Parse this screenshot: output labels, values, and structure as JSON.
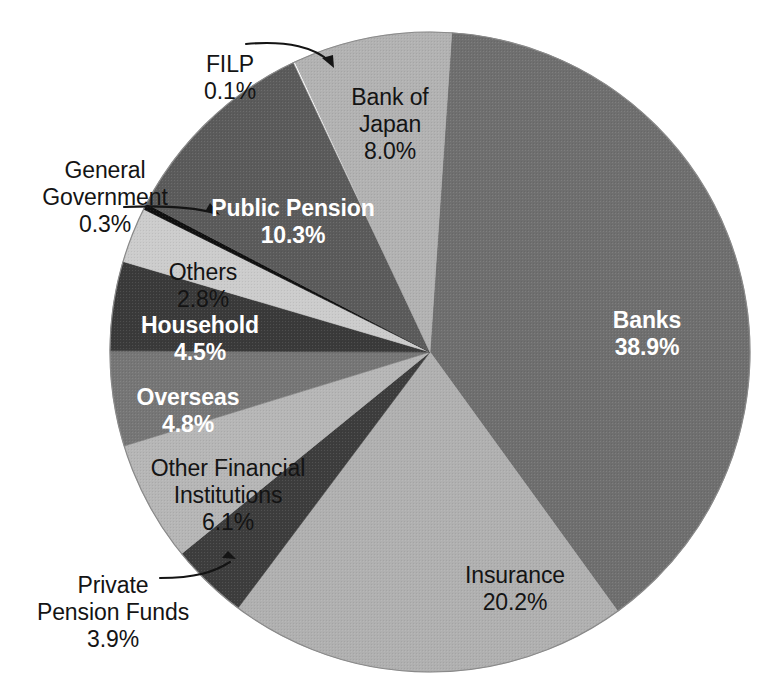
{
  "chart_data": {
    "type": "pie",
    "title": "",
    "subtitle": "",
    "xlabel": "",
    "ylabel": "",
    "legend_position": "none",
    "grid": false,
    "value_unit": "percent",
    "total": 99.9,
    "categories": [
      "Banks",
      "Insurance",
      "Private Pension Funds",
      "Other Financial Institutions",
      "Overseas",
      "Household",
      "Others",
      "General Government",
      "Public Pension",
      "FILP",
      "Bank of Japan"
    ],
    "values": [
      38.9,
      20.2,
      3.9,
      6.1,
      4.8,
      4.5,
      2.8,
      0.3,
      10.3,
      0.1,
      8.0
    ],
    "slices": [
      {
        "name": "Banks",
        "value": 38.9,
        "value_text": "38.9%",
        "color": "#6f6f6f",
        "label_placement": "inside",
        "label_color": "#ffffff",
        "label_bold": true
      },
      {
        "name": "Insurance",
        "value": 20.2,
        "value_text": "20.2%",
        "color": "#b0b0b0",
        "label_placement": "inside",
        "label_color": "#141414",
        "label_bold": false
      },
      {
        "name": "Private Pension Funds",
        "value": 3.9,
        "value_text": "3.9%",
        "color": "#3d3d3d",
        "label_placement": "callout",
        "label_color": "#141414",
        "label_bold": false
      },
      {
        "name": "Other Financial Institutions",
        "value": 6.1,
        "value_text": "6.1%",
        "color": "#b6b6b6",
        "label_placement": "inside",
        "label_color": "#141414",
        "label_bold": false
      },
      {
        "name": "Overseas",
        "value": 4.8,
        "value_text": "4.8%",
        "color": "#767676",
        "label_placement": "inside",
        "label_color": "#ffffff",
        "label_bold": true
      },
      {
        "name": "Household",
        "value": 4.5,
        "value_text": "4.5%",
        "color": "#3a3a3a",
        "label_placement": "inside",
        "label_color": "#ffffff",
        "label_bold": true
      },
      {
        "name": "Others",
        "value": 2.8,
        "value_text": "2.8%",
        "color": "#cccccc",
        "label_placement": "inside",
        "label_color": "#141414",
        "label_bold": false
      },
      {
        "name": "General Government",
        "value": 0.3,
        "value_text": "0.3%",
        "color": "#101010",
        "label_placement": "callout",
        "label_color": "#141414",
        "label_bold": false
      },
      {
        "name": "Public Pension",
        "value": 10.3,
        "value_text": "10.3%",
        "color": "#5b5b5b",
        "label_placement": "inside",
        "label_color": "#ffffff",
        "label_bold": true
      },
      {
        "name": "FILP",
        "value": 0.1,
        "value_text": "0.1%",
        "color": "#ffffff",
        "label_placement": "callout",
        "label_color": "#141414",
        "label_bold": false
      },
      {
        "name": "Bank of Japan",
        "value": 8.0,
        "value_text": "8.0%",
        "color": "#b2b2b2",
        "label_placement": "inside",
        "label_color": "#141414",
        "label_bold": false
      }
    ]
  },
  "labels": {
    "banks": {
      "name": "Banks",
      "pct": "38.9%"
    },
    "boj": {
      "name": "Bank of\nJapan",
      "pct": "8.0%"
    },
    "pubpen": {
      "name": "Public Pension",
      "pct": "10.3%"
    },
    "others": {
      "name": "Others",
      "pct": "2.8%"
    },
    "house": {
      "name": "Household",
      "pct": "4.5%"
    },
    "over": {
      "name": "Overseas",
      "pct": "4.8%"
    },
    "ofi": {
      "name": "Other Financial\nInstitutions",
      "pct": "6.1%"
    },
    "ins": {
      "name": "Insurance",
      "pct": "20.2%"
    },
    "filp": {
      "name": "FILP",
      "pct": "0.1%"
    },
    "genov": {
      "name": "General\nGovernment",
      "pct": "0.3%"
    },
    "privpen": {
      "name": "Private\nPension Funds",
      "pct": "3.9%"
    }
  },
  "geometry": {
    "center_x": 430,
    "center_y": 352,
    "radius": 320
  }
}
